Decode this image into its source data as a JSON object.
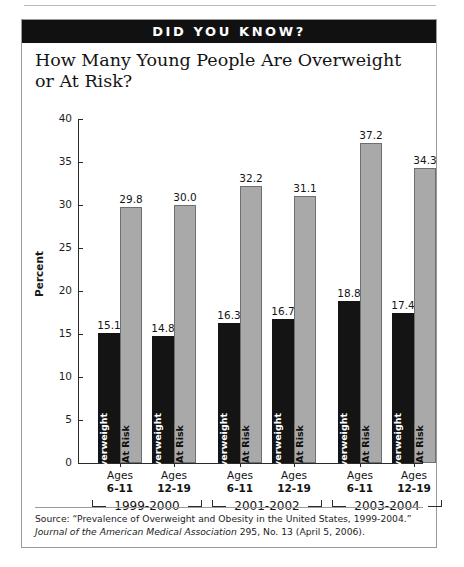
{
  "banner": {
    "text": "DID YOU KNOW?"
  },
  "chart_data": {
    "type": "bar",
    "title": "How Many Young People Are Overweight or At Risk?",
    "xlabel": "",
    "ylabel": "Percent",
    "ylim": [
      0,
      40
    ],
    "yticks": [
      0,
      5,
      10,
      15,
      20,
      25,
      30,
      35,
      40
    ],
    "grid": false,
    "legend_position": "in-bar",
    "categories": [
      "1999-2000 Ages 6-11",
      "1999-2000 Ages 12-19",
      "2001-2002 Ages 6-11",
      "2001-2002 Ages 12-19",
      "2003-2004 Ages 6-11",
      "2003-2004 Ages 12-19"
    ],
    "series": [
      {
        "name": "Overweight",
        "values": [
          15.1,
          14.8,
          16.3,
          16.7,
          18.8,
          17.4
        ],
        "color": "#141414"
      },
      {
        "name": "At Risk",
        "values": [
          29.8,
          30.0,
          32.2,
          31.1,
          37.2,
          34.3
        ],
        "color": "#a9a9a9"
      }
    ],
    "groups": [
      {
        "year": "1999-2000",
        "ages": [
          {
            "line1": "Ages",
            "line2": "6-11",
            "overweight": 15.1,
            "at_risk": 29.8
          },
          {
            "line1": "Ages",
            "line2": "12-19",
            "overweight": 14.8,
            "at_risk": 30.0
          }
        ]
      },
      {
        "year": "2001-2002",
        "ages": [
          {
            "line1": "Ages",
            "line2": "6-11",
            "overweight": 16.3,
            "at_risk": 32.2
          },
          {
            "line1": "Ages",
            "line2": "12-19",
            "overweight": 16.7,
            "at_risk": 31.1
          }
        ]
      },
      {
        "year": "2003-2004",
        "ages": [
          {
            "line1": "Ages",
            "line2": "6-11",
            "overweight": 18.8,
            "at_risk": 37.2
          },
          {
            "line1": "Ages",
            "line2": "12-19",
            "overweight": 17.4,
            "at_risk": 34.3
          }
        ]
      }
    ],
    "bar_labels": {
      "overweight": "Overweight",
      "at_risk": "At Risk"
    },
    "value_labels": [
      "15.1",
      "29.8",
      "14.8",
      "30.0",
      "16.3",
      "32.2",
      "16.7",
      "31.1",
      "18.8",
      "37.2",
      "17.4",
      "34.3"
    ]
  },
  "source": {
    "line1": "Source: “Prevalence of Overweight and Obesity in the United States, 1999-2004.”",
    "line2_italic": "Journal of the American Medical Association",
    "line2_rest": " 295, No. 13 (April 5, 2006)."
  }
}
